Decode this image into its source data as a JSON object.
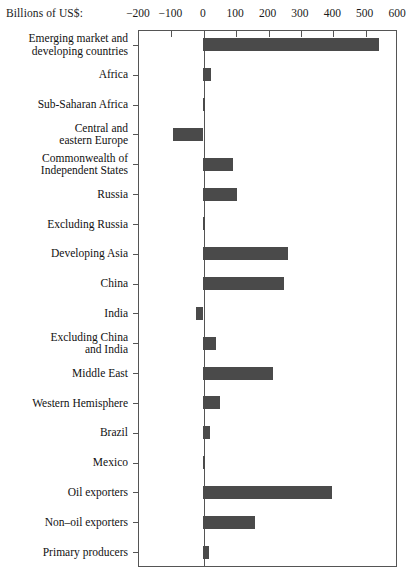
{
  "chart_data": {
    "type": "bar",
    "orientation": "horizontal",
    "title": "",
    "xlabel": "Billions of US$:",
    "ylabel": "",
    "xlim": [
      -200,
      600
    ],
    "xticks": [
      -200,
      -100,
      0,
      100,
      200,
      300,
      400,
      500,
      600
    ],
    "xtick_labels": [
      "−200",
      "−100",
      "0",
      "100",
      "200",
      "300",
      "400",
      "500",
      "600"
    ],
    "grid": false,
    "legend": false,
    "bar_color": "#4a4a4a",
    "categories": [
      "Emerging market and developing countries",
      "Africa",
      "Sub-Saharan Africa",
      "Central and eastern Europe",
      "Commonwealth of Independent States",
      "Russia",
      "Excluding Russia",
      "Developing Asia",
      "China",
      "India",
      "Excluding China and India",
      "Middle East",
      "Western Hemisphere",
      "Brazil",
      "Mexico",
      "Oil exporters",
      "Non–oil exporters",
      "Primary producers"
    ],
    "category_lines": [
      [
        "Emerging market and",
        "developing countries"
      ],
      [
        "Africa"
      ],
      [
        "Sub-Saharan Africa"
      ],
      [
        "Central and",
        "eastern Europe"
      ],
      [
        "Commonwealth of",
        "Independent States"
      ],
      [
        "Russia"
      ],
      [
        "Excluding Russia"
      ],
      [
        "Developing Asia"
      ],
      [
        "China"
      ],
      [
        "India"
      ],
      [
        "Excluding China",
        "and India"
      ],
      [
        "Middle East"
      ],
      [
        "Western Hemisphere"
      ],
      [
        "Brazil"
      ],
      [
        "Mexico"
      ],
      [
        "Oil exporters"
      ],
      [
        "Non–oil exporters"
      ],
      [
        "Primary producers"
      ]
    ],
    "values": [
      545,
      26,
      8,
      -93,
      93,
      107,
      6,
      264,
      252,
      -20,
      40,
      217,
      52,
      22,
      7,
      400,
      160,
      20
    ]
  }
}
